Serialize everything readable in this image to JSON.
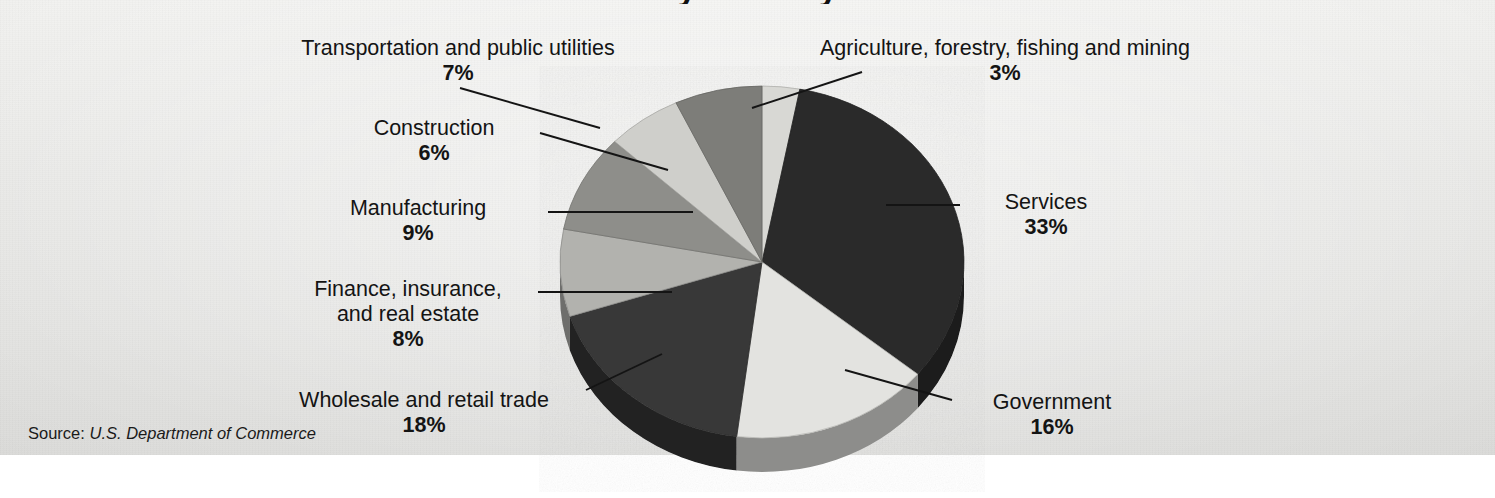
{
  "figure": {
    "title_partial": "by Industry",
    "source_prefix": "Source:",
    "source_name": "U.S. Department of Commerce"
  },
  "chart_data": {
    "type": "pie",
    "title": "by Industry",
    "three_d": true,
    "start_angle_deg": 0,
    "direction": "clockwise",
    "legend": "none",
    "value_unit": "percent",
    "total": 100,
    "labels": [
      "Agriculture, forestry, fishing and mining",
      "Services",
      "Government",
      "Wholesale and retail trade",
      "Finance, insurance, and real estate",
      "Manufacturing",
      "Construction",
      "Transportation and public utilities"
    ],
    "values": [
      3,
      33,
      16,
      18,
      8,
      9,
      6,
      7
    ],
    "colors": [
      "#d8d8d4",
      "#2a2a2a",
      "#e3e3e0",
      "#373737",
      "#b2b2ae",
      "#8e8e8a",
      "#cfcfcb",
      "#7d7d79"
    ],
    "slices": [
      {
        "name": "Agriculture, forestry, fishing and mining",
        "label_line1": "Agriculture, forestry, fishing and mining",
        "value": 3,
        "percent": "3%",
        "color": "#d8d8d4"
      },
      {
        "name": "Services",
        "label_line1": "Services",
        "value": 33,
        "percent": "33%",
        "color": "#2a2a2a"
      },
      {
        "name": "Government",
        "label_line1": "Government",
        "value": 16,
        "percent": "16%",
        "color": "#e3e3e0"
      },
      {
        "name": "Wholesale and retail trade",
        "label_line1": "Wholesale and retail trade",
        "value": 18,
        "percent": "18%",
        "color": "#373737"
      },
      {
        "name": "Finance, insurance, and real estate",
        "label_line1": "Finance, insurance,",
        "label_line2": "and real estate",
        "value": 8,
        "percent": "8%",
        "color": "#b2b2ae"
      },
      {
        "name": "Manufacturing",
        "label_line1": "Manufacturing",
        "value": 9,
        "percent": "9%",
        "color": "#8e8e8a"
      },
      {
        "name": "Construction",
        "label_line1": "Construction",
        "value": 6,
        "percent": "6%",
        "color": "#cfcfcb"
      },
      {
        "name": "Transportation and public utilities",
        "label_line1": "Transportation and public utilities",
        "value": 7,
        "percent": "7%",
        "color": "#7d7d79"
      }
    ]
  }
}
